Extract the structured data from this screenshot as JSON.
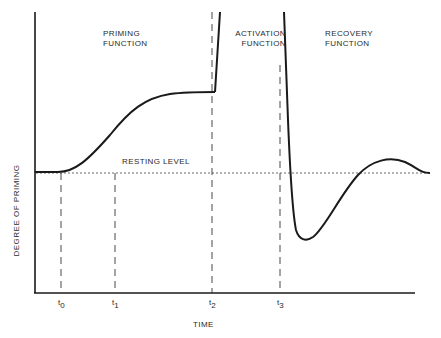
{
  "figure": {
    "type": "conceptual-curve-diagram",
    "axes": {
      "x_label": "TIME",
      "y_label": "DEGREE OF PRIMING"
    },
    "regions": [
      {
        "id": "priming",
        "line1": "PRIMING",
        "line2": "FUNCTION"
      },
      {
        "id": "activation",
        "line1": "ACTIVATION",
        "line2": "FUNCTION"
      },
      {
        "id": "recovery",
        "line1": "RECOVERY",
        "line2": "FUNCTION"
      }
    ],
    "reference_line": {
      "label": "RESTING LEVEL",
      "style": "dotted"
    },
    "time_markers": [
      {
        "label": "t",
        "sub": "0"
      },
      {
        "label": "t",
        "sub": "1"
      },
      {
        "label": "t",
        "sub": "2"
      },
      {
        "label": "t",
        "sub": "3"
      }
    ],
    "colors": {
      "ink": "#1a1a1a",
      "background": "#ffffff"
    }
  }
}
